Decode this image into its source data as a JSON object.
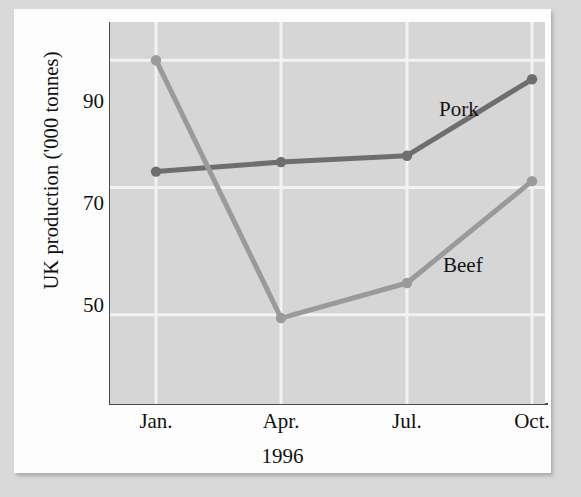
{
  "chart_data": {
    "type": "line",
    "title": "",
    "subtitle": "",
    "xlabel": "1996",
    "ylabel": "UK production ('000 tonnes)",
    "categories": [
      "Jan.",
      "Apr.",
      "Jul.",
      "Oct."
    ],
    "yticks": [
      50,
      70,
      90
    ],
    "ytick_labels": [
      "50",
      "70",
      "90"
    ],
    "ylim": [
      36,
      96
    ],
    "grid": true,
    "legend_position": "inline-annotation",
    "series": [
      {
        "name": "Pork",
        "label": "Pork",
        "color": "#6e6e6e",
        "values": [
          72.5,
          74,
          75,
          87
        ]
      },
      {
        "name": "Beef",
        "label": "Beef",
        "color": "#9a9a9a",
        "values": [
          90,
          49.5,
          55,
          71
        ]
      }
    ],
    "annotations": [
      {
        "text": "Pork",
        "series": "Pork"
      },
      {
        "text": "Beef",
        "series": "Beef"
      }
    ]
  },
  "colors": {
    "page_background": "#d9d9d9",
    "card_background": "#fdfdfd",
    "plot_background": "#d6d6d6",
    "axis": "#4a4a4a",
    "gridline": "#f2f2f2",
    "pork": "#6e6e6e",
    "beef": "#9a9a9a",
    "text": "#111111"
  }
}
